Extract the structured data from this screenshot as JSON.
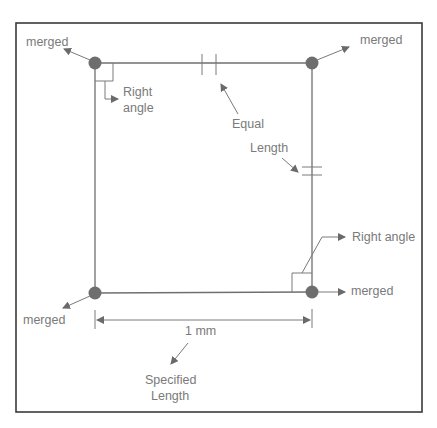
{
  "diagram": {
    "labels": {
      "merged_top_left": "merged",
      "merged_top_right": "merged",
      "merged_bottom_left": "merged",
      "merged_bottom_right": "merged",
      "right_angle_top_line1": "Right",
      "right_angle_top_line2": "angle",
      "equal": "Equal",
      "length": "Length",
      "right_angle_bottom": "Right angle",
      "dimension": "1 mm",
      "specified_line1": "Specified",
      "specified_line2": "Length"
    },
    "icons": {
      "corner_point": "filled-circle",
      "arrow": "triangle-arrowhead",
      "equal_marker": "double-tick",
      "right_angle_marker": "square-corner"
    },
    "colors": {
      "frame": "#3a3a3a",
      "lines": "#6f6f6f",
      "points": "#6e6e6e",
      "text": "#7a7a7a",
      "background": "#ffffff"
    }
  }
}
